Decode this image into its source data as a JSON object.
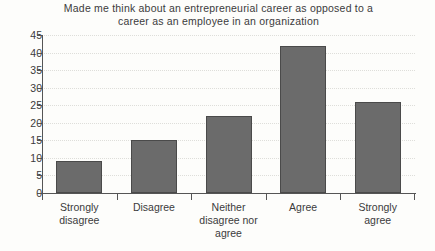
{
  "chart_data": {
    "type": "bar",
    "title": "Made me think about an entrepreneurial career as opposed to a career as an employee in an organization",
    "title_line1": "Made me think about an entrepreneurial career as opposed to a",
    "title_line2": "career as an employee in an organization",
    "categories": [
      "Strongly disagree",
      "Disagree",
      "Neither disagree nor agree",
      "Agree",
      "Strongly agree"
    ],
    "category_lines": [
      [
        "Strongly",
        "disagree"
      ],
      [
        "Disagree"
      ],
      [
        "Neither",
        "disagree nor",
        "agree"
      ],
      [
        "Agree"
      ],
      [
        "Strongly",
        "agree"
      ]
    ],
    "values": [
      9,
      15,
      22,
      42,
      26
    ],
    "xlabel": "",
    "ylabel": "",
    "ylim": [
      0,
      45
    ],
    "ytick_step": 5,
    "yticks": [
      0,
      5,
      10,
      15,
      20,
      25,
      30,
      35,
      40,
      45
    ],
    "grid": true,
    "grid_axis": "y",
    "legend": false,
    "bar_color": "#6b6b6b",
    "bar_edge_color": "#4a4a4a",
    "grid_color": "#dededa",
    "axis_color": "#555555",
    "text_color": "#3b3b3b",
    "background_color": "#fdfdfb"
  }
}
